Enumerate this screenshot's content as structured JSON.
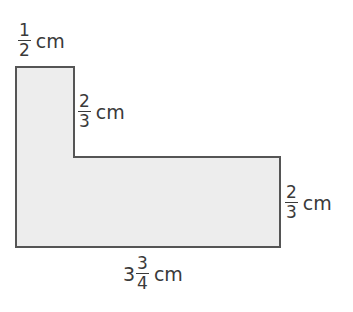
{
  "figure": {
    "shape": "L-shaped polygon",
    "fill_color": "#ededed",
    "stroke_color": "#555555"
  },
  "labels": {
    "top_width": {
      "numerator": "1",
      "denominator": "2",
      "unit": "cm"
    },
    "inner_height": {
      "numerator": "2",
      "denominator": "3",
      "unit": "cm"
    },
    "right_height": {
      "numerator": "2",
      "denominator": "3",
      "unit": "cm"
    },
    "bottom_length": {
      "whole": "3",
      "numerator": "3",
      "denominator": "4",
      "unit": "cm"
    }
  }
}
